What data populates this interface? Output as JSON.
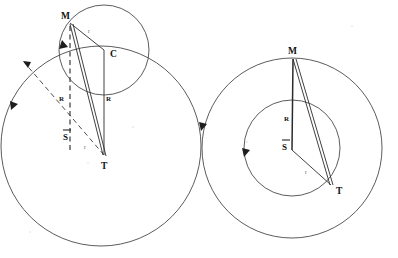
{
  "figure": {
    "name": "epicycle-deferent-geometry",
    "background_color": "#ffffff",
    "stroke_color": "#3a3a3a",
    "label_color": "#111111",
    "width": 398,
    "height": 258,
    "panel_count": 2
  },
  "panels": [
    {
      "id": "left-panel",
      "name": "epicycle-on-deferent",
      "description": "Large circle with a smaller circle centered on its upper rim; vectors drawn from T and M.",
      "circles": [
        {
          "name": "deferent-circle",
          "cx": 101,
          "cy": 146,
          "r": 100,
          "style": "solid",
          "label": ""
        },
        {
          "name": "epicycle-circle",
          "cx": 104,
          "cy": 50,
          "r": 45,
          "style": "solid",
          "label": ""
        }
      ],
      "points": [
        {
          "name": "point-M",
          "label": "M",
          "x": 70,
          "y": 22,
          "label_dx": -9,
          "label_dy": -3
        },
        {
          "name": "point-C",
          "label": "C",
          "x": 104,
          "y": 50,
          "label_dx": 5,
          "label_dy": 9
        },
        {
          "name": "point-T",
          "label": "T",
          "x": 104,
          "y": 155,
          "label_dx": -3,
          "label_dy": 14
        }
      ],
      "segments": [
        {
          "name": "segment-M-to-C",
          "from": [
            70,
            22
          ],
          "to": [
            104,
            50
          ],
          "style": "solid"
        },
        {
          "name": "segment-C-to-T",
          "from": [
            104,
            50
          ],
          "to": [
            104,
            155
          ],
          "style": "solid"
        },
        {
          "name": "segment-M-to-T",
          "from": [
            70,
            22
          ],
          "to": [
            104,
            155
          ],
          "style": "solid"
        },
        {
          "name": "segment-M-to-T-secondary",
          "from": [
            72,
            22
          ],
          "to": [
            106,
            155
          ],
          "style": "solid"
        },
        {
          "name": "segment-vertical-M-dashed",
          "from": [
            70,
            24
          ],
          "to": [
            70,
            150
          ],
          "style": "dashed"
        },
        {
          "name": "segment-S-bar-ray-dashed",
          "from": [
            104,
            155
          ],
          "to": [
            20,
            58
          ],
          "style": "dashed"
        }
      ],
      "arrows": [
        {
          "name": "arrow-epicycle-direction",
          "x": 62,
          "y": 44,
          "angle": 125
        },
        {
          "name": "arrow-deferent-direction",
          "x": 14,
          "y": 107,
          "angle": 118
        },
        {
          "name": "arrow-ray-tip",
          "x": 20,
          "y": 58,
          "angle": 225
        }
      ],
      "labels": [
        {
          "name": "label-r-epicycle",
          "text": "r",
          "x": 88,
          "y": 33,
          "size": "small"
        },
        {
          "name": "label-R-left",
          "text": "R",
          "x": 61,
          "y": 99,
          "size": "medium"
        },
        {
          "name": "label-R-right",
          "text": "R",
          "x": 106,
          "y": 99,
          "size": "medium"
        },
        {
          "name": "label-S-bar",
          "text": "S",
          "x": 66,
          "y": 136,
          "size": "medium",
          "overbar": true
        },
        {
          "name": "label-r-lower",
          "text": "r",
          "x": 84,
          "y": 148,
          "size": "small"
        }
      ]
    },
    {
      "id": "right-panel",
      "name": "concentric-deferent-epicycle",
      "description": "Two concentric circles sharing center S-bar with vectors from the center to M and T.",
      "circles": [
        {
          "name": "outer-circle",
          "cx": 292,
          "cy": 148,
          "r": 90,
          "style": "solid",
          "label": ""
        },
        {
          "name": "inner-circle",
          "cx": 292,
          "cy": 148,
          "r": 48,
          "style": "solid",
          "label": ""
        }
      ],
      "points": [
        {
          "name": "point-M",
          "label": "M",
          "x": 293,
          "y": 58,
          "label_dx": -3,
          "label_dy": -5
        },
        {
          "name": "point-S-bar",
          "label": "S",
          "x": 292,
          "y": 148,
          "label_dx": -10,
          "label_dy": -2
        },
        {
          "name": "point-T",
          "label": "T",
          "x": 331,
          "y": 185,
          "label_dx": 7,
          "label_dy": 9
        }
      ],
      "segments": [
        {
          "name": "segment-M-to-center",
          "from": [
            293,
            58
          ],
          "to": [
            292,
            150
          ],
          "style": "solid-thick"
        },
        {
          "name": "segment-center-to-T",
          "from": [
            292,
            150
          ],
          "to": [
            331,
            185
          ],
          "style": "solid"
        },
        {
          "name": "segment-M-to-T",
          "from": [
            293,
            58
          ],
          "to": [
            331,
            185
          ],
          "style": "solid"
        },
        {
          "name": "segment-M-to-T-secondary",
          "from": [
            295,
            58
          ],
          "to": [
            333,
            185
          ],
          "style": "solid"
        }
      ],
      "arrows": [
        {
          "name": "arrow-outer-direction",
          "x": 203,
          "y": 127,
          "angle": 100
        },
        {
          "name": "arrow-inner-direction",
          "x": 246,
          "y": 153,
          "angle": 100
        }
      ],
      "labels": [
        {
          "name": "label-R",
          "text": "R",
          "x": 285,
          "y": 118,
          "size": "medium"
        },
        {
          "name": "label-S-bar",
          "text": "S",
          "x": 285,
          "y": 148,
          "size": "medium",
          "overbar": true
        },
        {
          "name": "label-r",
          "text": "r",
          "x": 305,
          "y": 172,
          "size": "small"
        }
      ]
    }
  ],
  "legend_keys": {
    "R": "deferent radius",
    "r": "epicycle radius",
    "M": "moving body",
    "C": "epicycle center",
    "T": "terrestrial / reference point",
    "S": "mean sun (S-bar)"
  }
}
